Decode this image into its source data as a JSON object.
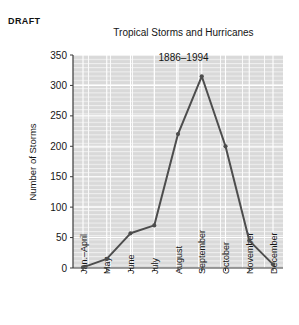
{
  "annotation": {
    "draft_label": "DRAFT"
  },
  "chart_data": {
    "type": "line",
    "title": "Tropical Storms and Hurricanes",
    "subtitle": "1886-1994",
    "title_line1": "Tropical Storms and Hurricanes",
    "title_line2": "1886–1994",
    "xlabel": "",
    "ylabel": "Number of Storms",
    "categories": [
      "Jan.–April",
      "May",
      "June",
      "July",
      "August",
      "September",
      "October",
      "November",
      "December"
    ],
    "values": [
      1,
      15,
      57,
      70,
      220,
      315,
      200,
      45,
      6
    ],
    "ylim": [
      0,
      350
    ],
    "yticks": [
      0,
      50,
      100,
      150,
      200,
      250,
      300,
      350
    ],
    "ytick_labels": [
      "0",
      "50",
      "100",
      "150",
      "200",
      "250",
      "300",
      "350"
    ],
    "grid": true,
    "legend": null,
    "series": [
      {
        "name": "Number of Storms",
        "values": [
          1,
          15,
          57,
          70,
          220,
          315,
          200,
          45,
          6
        ]
      }
    ],
    "colors": {
      "line": "#4d4d4d",
      "marker": "#4d4d4d",
      "plot_background": "#d9d9d9",
      "gridline": "#f2f2f2",
      "axis": "#3a3a3a",
      "text": "#151515"
    }
  }
}
